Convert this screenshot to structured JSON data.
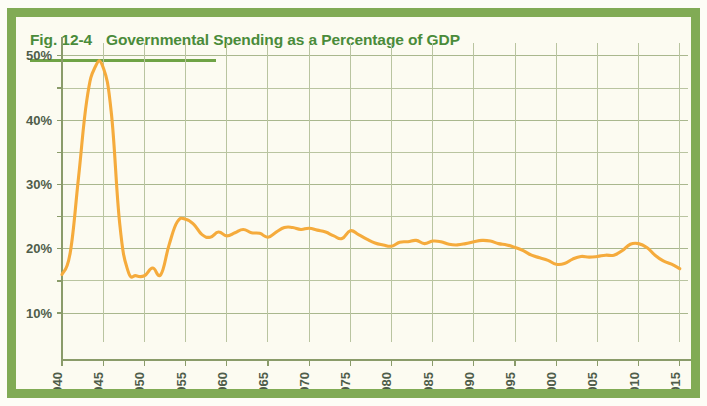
{
  "figure": {
    "fig_number": "Fig. 12-4",
    "title": "Governmental Spending as a Percentage of GDP",
    "border_color": "#81ab55",
    "title_color": "#4a8b3a",
    "series_color": "#f5ab3c",
    "grid_color": "#b9c4a0",
    "background_color": "#fcfbf1"
  },
  "chart_data": {
    "type": "line",
    "title": "Governmental Spending as a Percentage of GDP",
    "xlabel": "",
    "ylabel": "",
    "xlim": [
      1940,
      2016
    ],
    "ylim": [
      5.5,
      52
    ],
    "grid": true,
    "legend": "none",
    "y_ticks": [
      10,
      20,
      30,
      40,
      50
    ],
    "y_tick_labels": [
      "10%",
      "20%",
      "30%",
      "40%",
      "50%"
    ],
    "y_minor_ticks": [
      15,
      25,
      35,
      45
    ],
    "x_ticks": [
      1940,
      1945,
      1950,
      1955,
      1960,
      1965,
      1970,
      1975,
      1980,
      1985,
      1990,
      1995,
      2000,
      2005,
      2010,
      2015
    ],
    "x_tick_labels": [
      "1940",
      "1945",
      "1950",
      "1955",
      "1960",
      "1965",
      "1970",
      "1975",
      "1980",
      "1985",
      "1990",
      "1995",
      "2000",
      "2005",
      "2010",
      "2015"
    ],
    "series": [
      {
        "name": "Governmental spending as % of GDP",
        "color": "#f5ab3c",
        "x": [
          1940,
          1941,
          1942,
          1943,
          1944,
          1945,
          1946,
          1947,
          1948,
          1949,
          1950,
          1951,
          1952,
          1953,
          1954,
          1955,
          1956,
          1957,
          1958,
          1959,
          1960,
          1961,
          1962,
          1963,
          1964,
          1965,
          1966,
          1967,
          1968,
          1969,
          1970,
          1971,
          1972,
          1973,
          1974,
          1975,
          1976,
          1977,
          1978,
          1979,
          1980,
          1981,
          1982,
          1983,
          1984,
          1985,
          1986,
          1987,
          1988,
          1989,
          1990,
          1991,
          1992,
          1993,
          1994,
          1995,
          1996,
          1997,
          1998,
          1999,
          2000,
          2001,
          2002,
          2003,
          2004,
          2005,
          2006,
          2007,
          2008,
          2009,
          2010,
          2011,
          2012,
          2013,
          2014,
          2015
        ],
        "y": [
          16.0,
          19.4,
          31.0,
          43.0,
          48.2,
          48.2,
          41.0,
          24.0,
          16.6,
          15.8,
          15.8,
          17.0,
          16.0,
          20.6,
          24.2,
          24.6,
          23.8,
          22.2,
          21.8,
          22.6,
          22.0,
          22.5,
          23.0,
          22.5,
          22.4,
          21.8,
          22.6,
          23.3,
          23.3,
          23.0,
          23.2,
          22.9,
          22.6,
          22.0,
          21.6,
          22.8,
          22.2,
          21.5,
          20.9,
          20.6,
          20.4,
          21.0,
          21.1,
          21.3,
          20.8,
          21.2,
          21.1,
          20.7,
          20.6,
          20.8,
          21.1,
          21.3,
          21.2,
          20.8,
          20.6,
          20.2,
          19.7,
          19.0,
          18.6,
          18.2,
          17.6,
          17.7,
          18.4,
          18.8,
          18.7,
          18.8,
          19.0,
          19.0,
          19.7,
          20.7,
          20.8,
          20.2,
          19.0,
          18.1,
          17.6,
          16.9
        ]
      }
    ],
    "annotations": []
  }
}
